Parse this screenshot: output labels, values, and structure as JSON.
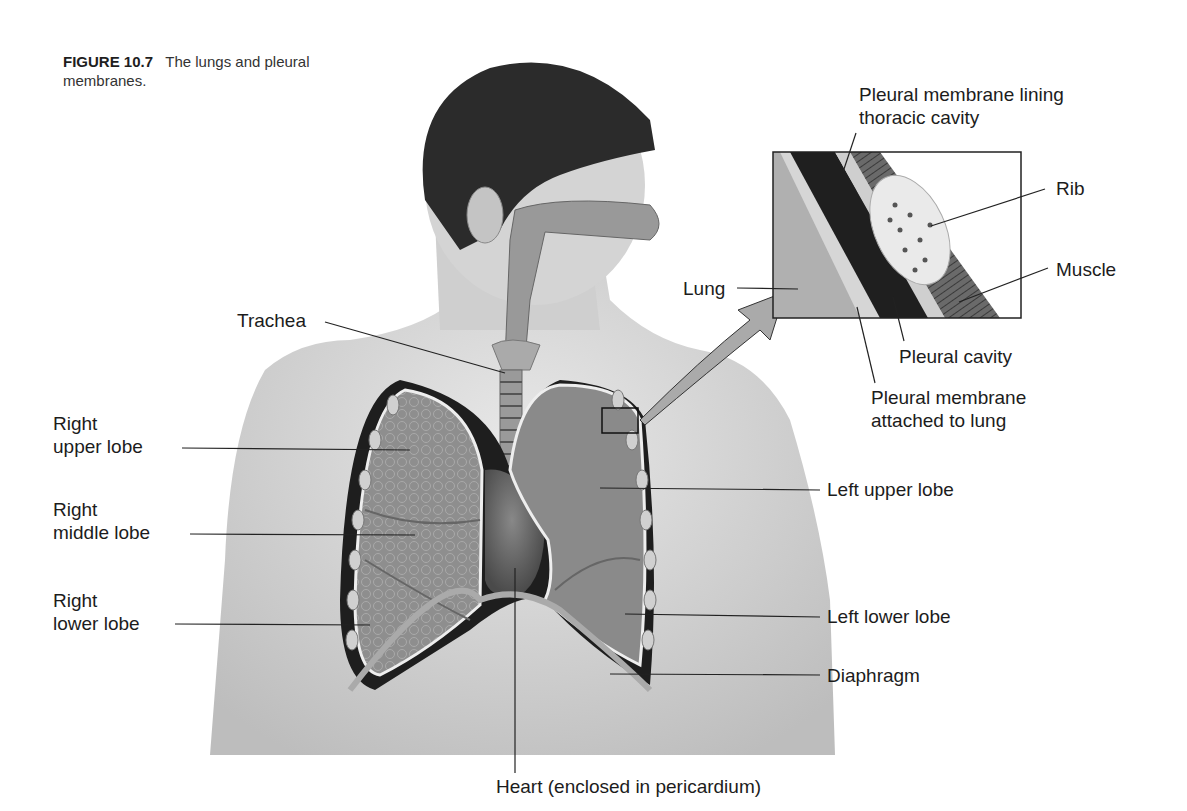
{
  "figure": {
    "number": "FIGURE 10.7",
    "caption": "The lungs and pleural membranes."
  },
  "labels": {
    "trachea": "Trachea",
    "right_upper_lobe": [
      "Right",
      "upper lobe"
    ],
    "right_middle_lobe": [
      "Right",
      "middle lobe"
    ],
    "right_lower_lobe": [
      "Right",
      "lower lobe"
    ],
    "left_upper_lobe": "Left upper lobe",
    "left_lower_lobe": "Left lower lobe",
    "diaphragm": "Diaphragm",
    "heart": "Heart (enclosed in pericardium)"
  },
  "inset": {
    "pleural_lining": [
      "Pleural membrane lining",
      "thoracic cavity"
    ],
    "rib": "Rib",
    "muscle": "Muscle",
    "lung": "Lung",
    "pleural_cavity": "Pleural cavity",
    "pleural_attached": [
      "Pleural membrane",
      "attached to lung"
    ]
  },
  "colors": {
    "background": "#ffffff",
    "skin": "#d9d9d9",
    "hair": "#2b2b2b",
    "lung": "#8f8f8f",
    "cavity": "#1e1e1e",
    "text": "#1c1c1c"
  }
}
